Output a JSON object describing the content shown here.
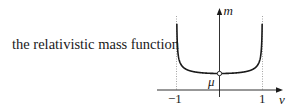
{
  "caption": "the relativistic mass function",
  "chart_data": {
    "type": "line",
    "title": "the relativistic mass function",
    "xlabel": "v",
    "ylabel": "m",
    "x_ticks": [
      "−1",
      "1"
    ],
    "annotations": [
      "μ"
    ],
    "asymptotes": [
      -1,
      1
    ],
    "function": "m = μ / sqrt(1 − v²)",
    "xlim": [
      -1,
      1
    ],
    "minimum": {
      "x": 0,
      "y_label": "μ"
    },
    "grid": false,
    "legend": null
  },
  "labels": {
    "x_axis": "v",
    "y_axis": "m",
    "tick_neg": "−1",
    "tick_pos": "1",
    "mu": "μ"
  },
  "colors": {
    "curve": "#1a1a1a",
    "axis": "#1a1a1a",
    "asymptote": "#9a9a9a"
  }
}
